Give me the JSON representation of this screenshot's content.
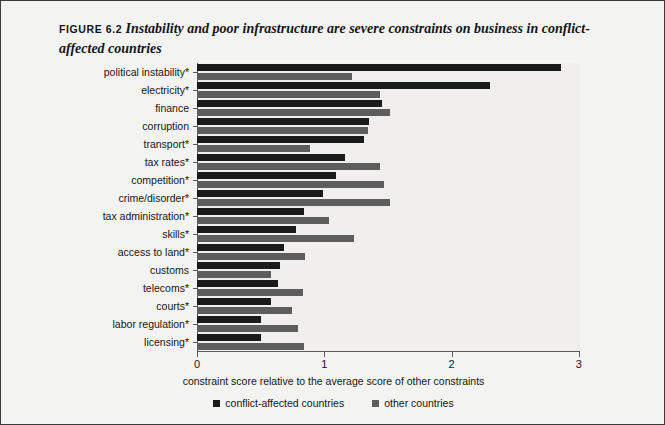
{
  "figure": {
    "label": "FIGURE 6.2",
    "title": "Instability and poor infrastructure are severe constraints on business in conflict-affected countries"
  },
  "legend": {
    "items": [
      {
        "label": "conflict-affected countries",
        "color": "#1b1b1b"
      },
      {
        "label": "other countries",
        "color": "#5d5d5d"
      }
    ]
  },
  "axes": {
    "xticks": [
      "0",
      "1",
      "2",
      "3"
    ],
    "xlabel": "constraint score relative to the average score of other constraints"
  },
  "chart_data": {
    "type": "bar",
    "orientation": "horizontal",
    "title": "Instability and poor infrastructure are severe constraints on business in conflict-affected countries",
    "xlabel": "constraint score relative to the average score of other constraints",
    "ylabel": "",
    "xlim": [
      0,
      3
    ],
    "xticks": [
      0,
      1,
      2,
      3
    ],
    "grid": false,
    "legend_position": "bottom",
    "categories": [
      "political instability*",
      "electricity*",
      "finance",
      "corruption",
      "transport*",
      "tax rates*",
      "competition*",
      "crime/disorder*",
      "tax administration*",
      "skills*",
      "access to land*",
      "customs",
      "telecoms*",
      "courts*",
      "labor regulation*",
      "licensing*"
    ],
    "series": [
      {
        "name": "conflict-affected countries",
        "color": "#1b1b1b",
        "values": [
          2.86,
          2.3,
          1.45,
          1.35,
          1.31,
          1.16,
          1.09,
          0.99,
          0.84,
          0.78,
          0.68,
          0.65,
          0.64,
          0.58,
          0.5,
          0.5
        ]
      },
      {
        "name": "other countries",
        "color": "#5d5d5d",
        "values": [
          1.22,
          1.44,
          1.52,
          1.34,
          0.89,
          1.44,
          1.47,
          1.52,
          1.04,
          1.23,
          0.85,
          0.58,
          0.83,
          0.75,
          0.79,
          0.84
        ]
      }
    ]
  }
}
